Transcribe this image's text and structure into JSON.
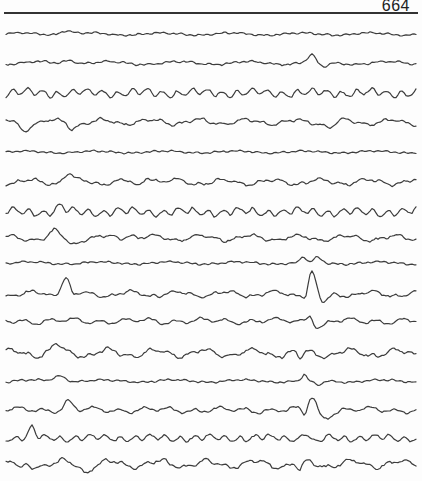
{
  "page": {
    "number": "664",
    "type": "EEG recording chart page",
    "trace_color": "#3c3c3c",
    "channel_count": 16
  },
  "traces": [
    {
      "id": 1,
      "y": 34,
      "amp": 1.2,
      "pattern": "low",
      "events": [
        {
          "x": 66,
          "h": -4,
          "w": 8
        }
      ]
    },
    {
      "id": 2,
      "y": 63,
      "amp": 1.5,
      "pattern": "low",
      "events": [
        {
          "x": 70,
          "h": -4,
          "w": 8
        },
        {
          "x": 312,
          "h": -8,
          "w": 6
        },
        {
          "x": 322,
          "h": 5,
          "w": 8
        }
      ]
    },
    {
      "id": 3,
      "y": 93,
      "amp": 3,
      "pattern": "alpha",
      "events": []
    },
    {
      "id": 4,
      "y": 122,
      "amp": 2.5,
      "pattern": "slow",
      "events": [
        {
          "x": 24,
          "h": 8,
          "w": 6
        },
        {
          "x": 72,
          "h": 5,
          "w": 6
        },
        {
          "x": 330,
          "h": 5,
          "w": 6
        }
      ]
    },
    {
      "id": 5,
      "y": 152,
      "amp": 1,
      "pattern": "low",
      "events": []
    },
    {
      "id": 6,
      "y": 182,
      "amp": 2.5,
      "pattern": "slow",
      "events": [
        {
          "x": 68,
          "h": -8,
          "w": 6
        },
        {
          "x": 138,
          "h": 6,
          "w": 6
        },
        {
          "x": 148,
          "h": -7,
          "w": 8
        }
      ]
    },
    {
      "id": 7,
      "y": 212,
      "amp": 3,
      "pattern": "alpha",
      "events": [
        {
          "x": 60,
          "h": -5,
          "w": 6
        }
      ]
    },
    {
      "id": 8,
      "y": 238,
      "amp": 2.5,
      "pattern": "slow",
      "events": [
        {
          "x": 55,
          "h": -6,
          "w": 6
        },
        {
          "x": 72,
          "h": 6,
          "w": 6
        },
        {
          "x": 130,
          "h": -5,
          "w": 6
        }
      ]
    },
    {
      "id": 9,
      "y": 263,
      "amp": 1.2,
      "pattern": "low",
      "events": [
        {
          "x": 303,
          "h": -6,
          "w": 3
        },
        {
          "x": 318,
          "h": -5,
          "w": 5
        }
      ]
    },
    {
      "id": 10,
      "y": 294,
      "amp": 2.5,
      "pattern": "slow",
      "events": [
        {
          "x": 66,
          "h": -20,
          "w": 6
        },
        {
          "x": 72,
          "h": 6,
          "w": 6
        },
        {
          "x": 306,
          "h": 8,
          "w": 3
        },
        {
          "x": 312,
          "h": -24,
          "w": 6
        },
        {
          "x": 322,
          "h": 10,
          "w": 8
        }
      ]
    },
    {
      "id": 11,
      "y": 321,
      "amp": 2,
      "pattern": "mixed",
      "events": [
        {
          "x": 310,
          "h": -8,
          "w": 4
        },
        {
          "x": 320,
          "h": 6,
          "w": 8
        }
      ]
    },
    {
      "id": 12,
      "y": 353,
      "amp": 3.5,
      "pattern": "slow",
      "events": [
        {
          "x": 56,
          "h": -7,
          "w": 6
        },
        {
          "x": 300,
          "h": 8,
          "w": 4
        }
      ]
    },
    {
      "id": 13,
      "y": 381,
      "amp": 1.2,
      "pattern": "low",
      "events": [
        {
          "x": 60,
          "h": -6,
          "w": 8
        },
        {
          "x": 304,
          "h": -6,
          "w": 3
        },
        {
          "x": 318,
          "h": 5,
          "w": 6
        }
      ]
    },
    {
      "id": 14,
      "y": 410,
      "amp": 2,
      "pattern": "mixed",
      "events": [
        {
          "x": 68,
          "h": -8,
          "w": 6
        },
        {
          "x": 305,
          "h": 8,
          "w": 3
        },
        {
          "x": 312,
          "h": -14,
          "w": 6
        },
        {
          "x": 324,
          "h": 8,
          "w": 8
        }
      ]
    },
    {
      "id": 15,
      "y": 438,
      "amp": 2.5,
      "pattern": "alpha",
      "events": [
        {
          "x": 32,
          "h": -10,
          "w": 4
        },
        {
          "x": 306,
          "h": -6,
          "w": 4
        },
        {
          "x": 316,
          "h": 5,
          "w": 6
        }
      ]
    },
    {
      "id": 16,
      "y": 464,
      "amp": 3.5,
      "pattern": "slow",
      "events": [
        {
          "x": 20,
          "h": 7,
          "w": 4
        },
        {
          "x": 86,
          "h": 6,
          "w": 6
        },
        {
          "x": 300,
          "h": 8,
          "w": 4
        }
      ]
    }
  ],
  "layout": {
    "x_start": 6,
    "x_end": 416,
    "header_rule_y": 12
  }
}
